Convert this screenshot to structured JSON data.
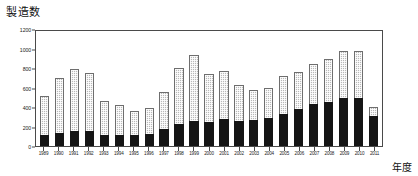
{
  "chart_data": {
    "type": "bar",
    "title": "",
    "ylabel": "製造数",
    "xlabel": "年度",
    "ylim": [
      0,
      1200
    ],
    "yticks": [
      0,
      200,
      400,
      600,
      800,
      1000,
      1200
    ],
    "grid": false,
    "legend": null,
    "stacked": true,
    "categories": [
      "1989",
      "1990",
      "1991",
      "1992",
      "1993",
      "1994",
      "1995",
      "1996",
      "1997",
      "1998",
      "1999",
      "2000",
      "2001",
      "2002",
      "2003",
      "2004",
      "2005",
      "2006",
      "2007",
      "2008",
      "2009",
      "2010",
      "2011"
    ],
    "series": [
      {
        "name": "lower-black-segment",
        "color": "#151515",
        "values": [
          110,
          130,
          150,
          150,
          110,
          110,
          110,
          120,
          170,
          230,
          260,
          250,
          280,
          260,
          270,
          290,
          330,
          380,
          430,
          450,
          490,
          490,
          310
        ]
      },
      {
        "name": "upper-dotted-segment",
        "color": "#b9b9b9",
        "values": [
          400,
          570,
          640,
          600,
          350,
          310,
          250,
          270,
          380,
          570,
          670,
          490,
          490,
          370,
          300,
          300,
          390,
          380,
          410,
          440,
          480,
          480,
          90
        ]
      }
    ],
    "totals": [
      510,
      700,
      790,
      750,
      460,
      420,
      360,
      390,
      550,
      800,
      930,
      740,
      770,
      630,
      570,
      590,
      720,
      760,
      840,
      890,
      970,
      970,
      400
    ]
  }
}
